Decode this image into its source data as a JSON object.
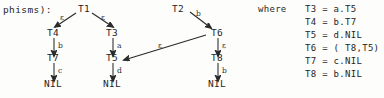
{
  "figure": {
    "prefix_text": "phisms):",
    "type": "labeled-transition-tree-diagram"
  },
  "trees": {
    "tree1": {
      "root": "T1",
      "left_edge_label": "ε",
      "right_edge_label": "ε",
      "left_child": "T4",
      "right_child": "T3",
      "left_chain": {
        "edge1_label": "b",
        "node1": "T7",
        "edge2_label": "c",
        "terminal": "NIL"
      },
      "right_chain": {
        "edge1_label": "a",
        "node1": "T5",
        "edge2_label": "d",
        "terminal": "NIL"
      }
    },
    "tree2": {
      "root": "T2",
      "edge_label": "b",
      "child": "T6",
      "cross_edge_label": "ε",
      "cross_edge_target": "T5",
      "chain": {
        "edge1_label": "ε",
        "node1": "T8",
        "edge2_label": "b",
        "terminal": "NIL"
      }
    }
  },
  "where_block": {
    "keyword": "where",
    "definitions": [
      "T3 = a.T5",
      "T4 = b.T7",
      "T5 = d.NIL",
      "T6 = ( T8,T5)",
      "T7 = c.NIL",
      "T8 = b.NIL"
    ]
  },
  "colors": {
    "ink": "#262626",
    "paper": "#fdfdfc"
  }
}
